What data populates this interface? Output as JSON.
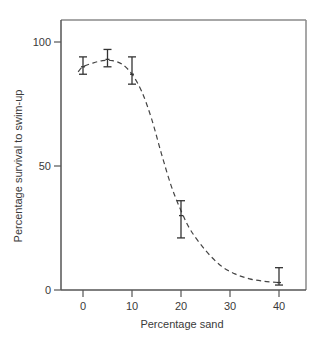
{
  "chart_data": {
    "type": "scatter",
    "title": "",
    "xlabel": "Percentage sand",
    "ylabel": "Percentage survival to swim-up",
    "xlim": [
      -5,
      45
    ],
    "ylim": [
      0,
      100
    ],
    "x_ticks": [
      0,
      10,
      20,
      30,
      40
    ],
    "y_ticks": [
      0,
      50,
      100
    ],
    "grid": false,
    "legend": null,
    "series": [
      {
        "name": "Survival to swim-up",
        "marker": "mean with error bars",
        "x": [
          0,
          5,
          10,
          20,
          40
        ],
        "values": [
          90,
          93,
          87,
          30,
          3
        ],
        "error_low": [
          87,
          90,
          83,
          21,
          2
        ],
        "error_high": [
          94,
          97,
          94,
          36,
          9
        ]
      }
    ],
    "fit_curve": {
      "style": "dashed",
      "description": "Sigmoidal fitted curve through means",
      "x": [
        -1,
        0,
        2,
        4,
        6,
        8,
        10,
        12,
        14,
        16,
        18,
        20,
        22,
        25,
        28,
        31,
        34,
        37,
        40
      ],
      "y": [
        88,
        90,
        91.5,
        92.5,
        92.5,
        91,
        87,
        80,
        69,
        55,
        42,
        32,
        24,
        16,
        10,
        6.5,
        4.5,
        3.5,
        3
      ]
    }
  },
  "axes": {
    "x_tick_labels": [
      "0",
      "10",
      "20",
      "30",
      "40"
    ],
    "y_tick_labels": [
      "0",
      "50",
      "100"
    ],
    "xlabel": "Percentage sand",
    "ylabel": "Percentage survival to swim-up"
  }
}
